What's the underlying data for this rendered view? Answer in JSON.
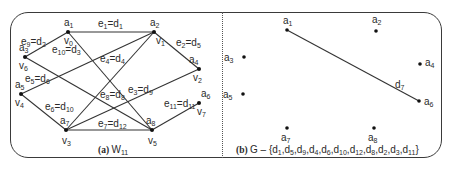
{
  "figure": {
    "left_panel": {
      "caption_prefix": "(a)",
      "caption": "W",
      "caption_sub": "11",
      "nodes": [
        {
          "id": "a1",
          "label": "a",
          "sub": "1",
          "alt": "v",
          "alt_sub": "0",
          "x": 68,
          "y": 32
        },
        {
          "id": "a2",
          "label": "a",
          "sub": "2",
          "alt": "v",
          "alt_sub": "1",
          "x": 154,
          "y": 32
        },
        {
          "id": "a3",
          "label": "a",
          "sub": "3",
          "alt": "v",
          "alt_sub": "6",
          "x": 25,
          "y": 57
        },
        {
          "id": "a4",
          "label": "a",
          "sub": "4",
          "alt": "v",
          "alt_sub": "2",
          "x": 199,
          "y": 69
        },
        {
          "id": "a5",
          "label": "a",
          "sub": "5",
          "alt": "v",
          "alt_sub": "4",
          "x": 21,
          "y": 94
        },
        {
          "id": "a6",
          "label": "a",
          "sub": "6",
          "alt": "v",
          "alt_sub": "7",
          "x": 199,
          "y": 103
        },
        {
          "id": "a7",
          "label": "a",
          "sub": "7",
          "alt": "v",
          "alt_sub": "3",
          "x": 66,
          "y": 130
        },
        {
          "id": "a8",
          "label": "a",
          "sub": "8",
          "alt": "v",
          "alt_sub": "5",
          "x": 152,
          "y": 130
        }
      ],
      "edges": [
        {
          "from": "a1",
          "to": "a2",
          "e": "1",
          "d": "1"
        },
        {
          "from": "a2",
          "to": "a4",
          "e": "2",
          "d": "5"
        },
        {
          "from": "a7",
          "to": "a4",
          "e": "3",
          "d": "9"
        },
        {
          "from": "a2",
          "to": "a7",
          "e": "4",
          "d": "4"
        },
        {
          "from": "a2",
          "to": "a5",
          "e": "5",
          "d": "6"
        },
        {
          "from": "a5",
          "to": "a7",
          "e": "6",
          "d": "10"
        },
        {
          "from": "a7",
          "to": "a8",
          "e": "7",
          "d": "12"
        },
        {
          "from": "a1",
          "to": "a8",
          "e": "8",
          "d": "8"
        },
        {
          "from": "a3",
          "to": "a1",
          "e": "9",
          "d": "2"
        },
        {
          "from": "a3",
          "to": "a8",
          "e": "10",
          "d": "3"
        },
        {
          "from": "a8",
          "to": "a6",
          "e": "11",
          "d": "11"
        }
      ]
    },
    "right_panel": {
      "caption_prefix": "(b)",
      "caption": "G – {d1,d5,d9,d4,d6,d10,d12,d8,d2,d3,d11}",
      "caption_removed": [
        "1",
        "5",
        "9",
        "4",
        "6",
        "10",
        "12",
        "8",
        "2",
        "3",
        "11"
      ],
      "nodes": [
        {
          "id": "a1",
          "label": "a",
          "sub": "1",
          "x": 287,
          "y": 30
        },
        {
          "id": "a2",
          "label": "a",
          "sub": "2",
          "x": 376,
          "y": 31
        },
        {
          "id": "a3",
          "label": "a",
          "sub": "3",
          "x": 244,
          "y": 57
        },
        {
          "id": "a4",
          "label": "a",
          "sub": "4",
          "x": 420,
          "y": 64
        },
        {
          "id": "a5",
          "label": "a",
          "sub": "5",
          "x": 243,
          "y": 94
        },
        {
          "id": "a6",
          "label": "a",
          "sub": "6",
          "x": 419,
          "y": 101
        },
        {
          "id": "a7",
          "label": "a",
          "sub": "7",
          "x": 287,
          "y": 128
        },
        {
          "id": "a8",
          "label": "a",
          "sub": "8",
          "x": 374,
          "y": 128
        }
      ],
      "edges": [
        {
          "from": "a1",
          "to": "a6",
          "label": "d",
          "sub": "7"
        }
      ]
    }
  }
}
